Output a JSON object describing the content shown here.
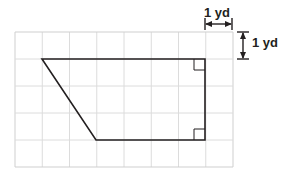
{
  "figure": {
    "colors": {
      "background": "#ffffff",
      "grid_line": "#d9d9d9",
      "grid_border": "#cfcfcf",
      "shape_stroke": "#231f20",
      "shape_fill": "none",
      "dimension_stroke": "#231f20",
      "text": "#231f20"
    },
    "grid": {
      "columns": 8,
      "rows": 5,
      "cell_width_px": 27.25,
      "cell_height_px": 27,
      "origin_x_px": 15,
      "origin_y_px": 32,
      "width_px": 218,
      "height_px": 135
    },
    "shape": {
      "name": "trapezoid",
      "vertices_px": [
        [
          42,
          59
        ],
        [
          205,
          59
        ],
        [
          205,
          140
        ],
        [
          96,
          140
        ]
      ],
      "vertices_grid_units": [
        [
          1,
          1
        ],
        [
          7,
          1
        ],
        [
          7,
          4
        ],
        [
          3,
          4
        ]
      ],
      "stroke_width_px": 1.6
    },
    "right_angle_markers": [
      {
        "name": "top-right-angle-marker",
        "x_px": 194,
        "y_px": 59,
        "size_px": 11,
        "corner": "top-right"
      },
      {
        "name": "bottom-right-angle-marker",
        "x_px": 194,
        "y_px": 129,
        "size_px": 11,
        "corner": "bottom-right"
      }
    ],
    "dimensions": {
      "width": {
        "label": "1 yd",
        "orientation": "horizontal",
        "value": 1,
        "unit": "yd",
        "arrow_start_x_px": 205,
        "arrow_end_x_px": 232,
        "arrow_y_px": 24,
        "tick_top_y_px": 18,
        "tick_bottom_y_px": 30
      },
      "height": {
        "label": "1 yd",
        "orientation": "vertical",
        "value": 1,
        "unit": "yd",
        "arrow_start_y_px": 32,
        "arrow_end_y_px": 59,
        "arrow_x_px": 243,
        "tick_left_x_px": 237,
        "tick_right_x_px": 249
      }
    }
  }
}
